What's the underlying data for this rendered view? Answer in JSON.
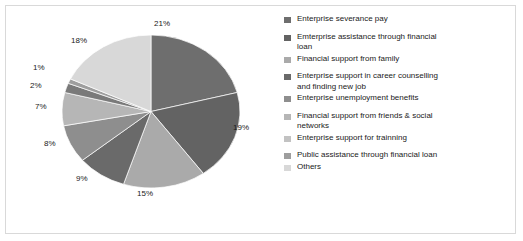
{
  "chart_data": {
    "type": "pie",
    "title": "",
    "subtitle": "",
    "xlabel": "",
    "ylabel": "",
    "legend_position": "right",
    "grid": false,
    "value_unit": "%",
    "labels": [
      "Enterprise severance pay",
      "Emterprise assistance through financial loan",
      "Financial support from family",
      "Enterprise support in career counselling and finding new job",
      "Enterprise unemployment benefits",
      "Financial support from friends & social networks",
      "Enterprise support for trainning",
      "Public assistance through financial loan",
      "Others"
    ],
    "slices": [
      {
        "label": "Enterprise severance pay",
        "value": 21,
        "display": "21%",
        "color": "#6e6e6e"
      },
      {
        "label": "Emterprise assistance through financial loan",
        "value": 19,
        "display": "19%",
        "color": "#636363"
      },
      {
        "label": "Financial support from family",
        "value": 15,
        "display": "15%",
        "color": "#aaaaaa"
      },
      {
        "label": "Enterprise support in career counselling and finding new job",
        "value": 9,
        "display": "9%",
        "color": "#6a6a6a"
      },
      {
        "label": "Enterprise unemployment benefits",
        "value": 8,
        "display": "8%",
        "color": "#8e8e8e"
      },
      {
        "label": "Financial support from friends & social networks",
        "value": 7,
        "display": "7%",
        "color": "#b6b6b6"
      },
      {
        "label": "Enterprise support for trainning",
        "value": 2,
        "display": "2%",
        "color": "#7a7a7a"
      },
      {
        "label": "Public assistance through financial loan",
        "value": 1,
        "display": "1%",
        "color": "#9e9e9e"
      },
      {
        "label": "Others",
        "value": 18,
        "display": "18%",
        "color": "#d8d8d8"
      }
    ],
    "data_labels": [
      "21%",
      "19%",
      "15%",
      "9%",
      "8%",
      "7%",
      "2%",
      "1%",
      "18%"
    ]
  },
  "legend": {
    "groups": [
      {
        "items": [
          {
            "label": "Enterprise severance pay",
            "color": "#6e6e6e"
          }
        ]
      },
      {
        "items": [
          {
            "label": "Emterprise assistance through financial loan",
            "color": "#636363"
          },
          {
            "label": "Financial support from family",
            "color": "#aaaaaa"
          }
        ]
      },
      {
        "items": [
          {
            "label": "Enterprise support in career counselling and finding new job",
            "color": "#6a6a6a"
          },
          {
            "label": "Enterprise unemployment benefits",
            "color": "#8e8e8e"
          }
        ]
      },
      {
        "items": [
          {
            "label": "Financial support from friends & social networks",
            "color": "#b6b6b6"
          },
          {
            "label": "Enterprise support for trainning",
            "color": "#c2c2c2"
          }
        ]
      },
      {
        "items": [
          {
            "label": "Public assistance through financial loan",
            "color": "#9e9e9e"
          },
          {
            "label": "Others",
            "color": "#d8d8d8"
          }
        ]
      }
    ]
  },
  "labels_on_pie": [
    {
      "text": "21%",
      "left": 148,
      "top": 13
    },
    {
      "text": "19%",
      "left": 227,
      "top": 117
    },
    {
      "text": "15%",
      "left": 131,
      "top": 183
    },
    {
      "text": "9%",
      "left": 70,
      "top": 168
    },
    {
      "text": "8%",
      "left": 38,
      "top": 133
    },
    {
      "text": "7%",
      "left": 29,
      "top": 96
    },
    {
      "text": "2%",
      "left": 24,
      "top": 75
    },
    {
      "text": "1%",
      "left": 27,
      "top": 57
    },
    {
      "text": "18%",
      "left": 65,
      "top": 30
    }
  ]
}
